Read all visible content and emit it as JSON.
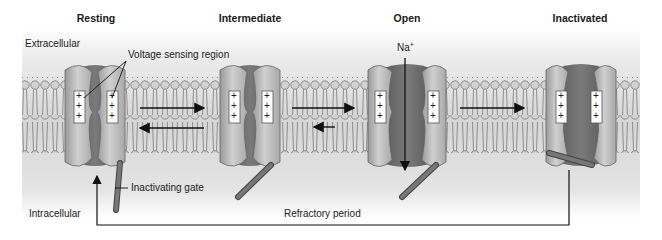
{
  "diagram": {
    "states": [
      {
        "id": "resting",
        "title": "Resting",
        "x": 95
      },
      {
        "id": "intermediate",
        "title": "Intermediate",
        "x": 250
      },
      {
        "id": "open",
        "title": "Open",
        "x": 407
      },
      {
        "id": "inactivated",
        "title": "Inactivated",
        "x": 581
      }
    ],
    "regions": {
      "extracellular": "Extracellular",
      "intracellular": "Intracellular"
    },
    "annotations": {
      "voltage_sensing": "Voltage sensing region",
      "inactivating_gate": "Inactivating gate",
      "ion": "Na",
      "ion_charge": "+",
      "refractory": "Refractory period"
    },
    "sensor_charges": [
      "+",
      "+",
      "+"
    ],
    "transitions": [
      {
        "from": "resting",
        "to": "intermediate",
        "direction": "forward"
      },
      {
        "from": "intermediate",
        "to": "resting",
        "direction": "reverse"
      },
      {
        "from": "intermediate",
        "to": "open",
        "direction": "forward"
      },
      {
        "from": "open",
        "to": "intermediate",
        "direction": "reverse"
      },
      {
        "from": "open",
        "to": "inactivated",
        "direction": "forward"
      },
      {
        "from": "inactivated",
        "to": "resting",
        "direction": "refractory-return"
      }
    ],
    "colors": {
      "background_top": "#f4f4f4",
      "background_mid": "#d9d9d9",
      "subunit": "#bdbdbd",
      "pore": "#6e6e6e",
      "gate": "#6a6a6a",
      "lipid": "#c8c8c8",
      "line": "#222222"
    }
  }
}
